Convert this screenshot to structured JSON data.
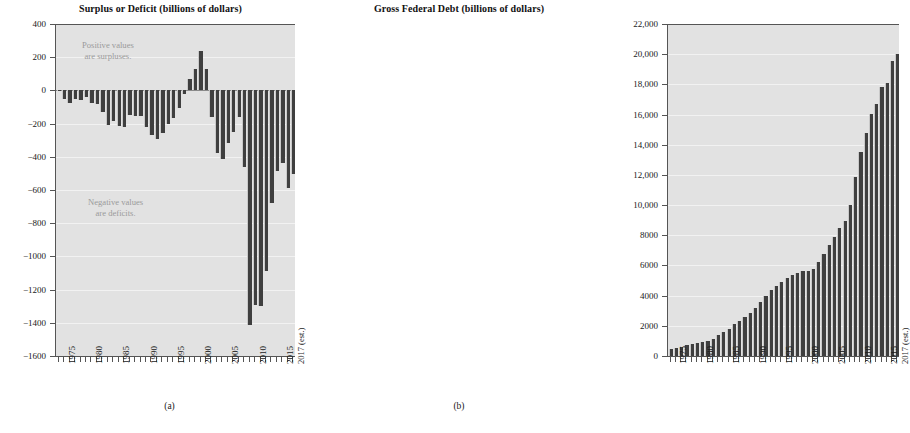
{
  "figure": {
    "panels": [
      {
        "key": "a",
        "caption": "(a)",
        "title": "Surplus or Deficit (billions of dollars)",
        "annotations": [
          {
            "name": "positive-values-note",
            "line1": "Positive values",
            "line2": "are surpluses."
          },
          {
            "name": "negative-values-note",
            "line1": "Negative values",
            "line2": "are deficits."
          }
        ]
      },
      {
        "key": "b",
        "caption": "(b)",
        "title": "Gross Federal Debt (billions of dollars)",
        "annotations": []
      }
    ]
  },
  "colors": {
    "bar": "#3f3f3f",
    "plot_background": "#e2e2e2",
    "gridline": "#f2f2f2",
    "axis": "#555555",
    "annotation_text": "#9a9a9a",
    "text": "#1a1a1a"
  },
  "chart_data": [
    {
      "type": "bar",
      "panel": "a",
      "title": "Surplus or Deficit (billions of dollars)",
      "xlabel": "",
      "ylabel": "",
      "ylim": [
        -1600,
        400
      ],
      "yticks": [
        400,
        200,
        0,
        -200,
        -400,
        -600,
        -800,
        -1000,
        -1200,
        -1400,
        -1600
      ],
      "ytick_labels": [
        "400",
        "200",
        "0",
        "−200",
        "−400",
        "−600",
        "−800",
        "−1000",
        "−1200",
        "−1400",
        "−1600"
      ],
      "xtick_labels": [
        "1975",
        "1980",
        "1985",
        "1990",
        "1995",
        "2000",
        "2005",
        "2010",
        "2015",
        "2017 (est.)"
      ],
      "xtick_label_years": [
        1975,
        1980,
        1985,
        1990,
        1995,
        2000,
        2005,
        2010,
        2015,
        2017
      ],
      "grid": true,
      "legend": "none",
      "x": [
        1974,
        1975,
        1976,
        1977,
        1978,
        1979,
        1980,
        1981,
        1982,
        1983,
        1984,
        1985,
        1986,
        1987,
        1988,
        1989,
        1990,
        1991,
        1992,
        1993,
        1994,
        1995,
        1996,
        1997,
        1998,
        1999,
        2000,
        2001,
        2002,
        2003,
        2004,
        2005,
        2006,
        2007,
        2008,
        2009,
        2010,
        2011,
        2012,
        2013,
        2014,
        2015,
        2016,
        2017
      ],
      "values": [
        -6,
        -53,
        -74,
        -54,
        -59,
        -41,
        -74,
        -79,
        -128,
        -208,
        -185,
        -212,
        -221,
        -150,
        -155,
        -153,
        -221,
        -269,
        -290,
        -255,
        -203,
        -164,
        -107,
        -22,
        69,
        126,
        236,
        128,
        -158,
        -378,
        -413,
        -318,
        -248,
        -161,
        -459,
        -1413,
        -1294,
        -1300,
        -1087,
        -680,
        -485,
        -438,
        -585,
        -503
      ],
      "annotations": [
        {
          "text": "Positive values are surpluses.",
          "x": 1986,
          "y": 240
        },
        {
          "text": "Negative values are deficits.",
          "x": 1988,
          "y": -700
        }
      ]
    },
    {
      "type": "bar",
      "panel": "b",
      "title": "Gross Federal Debt (billions of dollars)",
      "xlabel": "",
      "ylabel": "",
      "ylim": [
        0,
        22000
      ],
      "yticks": [
        22000,
        20000,
        18000,
        16000,
        14000,
        12000,
        10000,
        8000,
        6000,
        4000,
        2000,
        0
      ],
      "ytick_labels": [
        "22,000",
        "20,000",
        "18,000",
        "16,000",
        "14,000",
        "12,000",
        "10,000",
        "8000",
        "6000",
        "4000",
        "2000",
        "0"
      ],
      "xtick_labels": [
        "1975",
        "1980",
        "1985",
        "1990",
        "1995",
        "2000",
        "2005",
        "2010",
        "2015",
        "2017 (est.)"
      ],
      "xtick_label_years": [
        1975,
        1980,
        1985,
        1990,
        1995,
        2000,
        2005,
        2010,
        2015,
        2017
      ],
      "grid": true,
      "legend": "none",
      "x": [
        1974,
        1975,
        1976,
        1977,
        1978,
        1979,
        1980,
        1981,
        1982,
        1983,
        1984,
        1985,
        1986,
        1987,
        1988,
        1989,
        1990,
        1991,
        1992,
        1993,
        1994,
        1995,
        1996,
        1997,
        1998,
        1999,
        2000,
        2001,
        2002,
        2003,
        2004,
        2005,
        2006,
        2007,
        2008,
        2009,
        2010,
        2011,
        2012,
        2013,
        2014,
        2015,
        2016,
        2017
      ],
      "values": [
        484,
        541,
        629,
        706,
        777,
        829,
        909,
        995,
        1137,
        1372,
        1565,
        1818,
        2121,
        2346,
        2601,
        2868,
        3207,
        3598,
        4002,
        4351,
        4643,
        4921,
        5181,
        5369,
        5478,
        5606,
        5629,
        5770,
        6198,
        6760,
        7355,
        7905,
        8451,
        8951,
        9986,
        11876,
        13529,
        14764,
        16051,
        16719,
        17794,
        18120,
        19539,
        20033
      ]
    }
  ]
}
